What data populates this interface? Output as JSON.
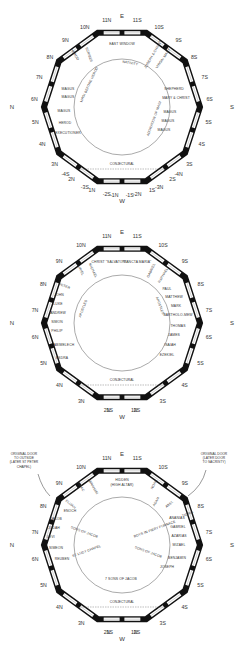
{
  "diagrams": [
    {
      "name": "plan-1",
      "cy": 107,
      "compass": {
        "top": "E",
        "bottom": "W",
        "left": "N",
        "right": "S"
      },
      "positions_left": [
        "11N",
        "10N",
        "9N",
        "8N",
        "7N",
        "6N",
        "5N",
        "4N",
        "3N",
        "2N",
        "1N",
        "-1N",
        "-2N",
        "-3N",
        "-4N"
      ],
      "positions_right": [
        "11S",
        "10S",
        "9S",
        "8S",
        "7S",
        "6S",
        "5S",
        "4S",
        "3S",
        "2S",
        "1S",
        "-1S",
        "-2S",
        "-3S",
        "-4S"
      ],
      "bottom_note": "CONJECTURAL",
      "labels": {
        "east_window": "EAST WINDOW",
        "nativity": "NATIVITY",
        "magi_before_herod": "MAGI BEFORE HEROD",
        "adoration_of_magi": "ADORATION OF MAGI",
        "herod": "HEROD",
        "scribes": "SCRIBES",
        "joseph_christ": "JOSEPH & CHRIST",
        "virgin_mary": "VIRGIN MARY",
        "shepherd": "SHEPHERD",
        "mary_christ": "MARY & CHRIST",
        "magus_l1": "MAGUS",
        "magus_l2": "MAGUS",
        "magus_l3": "MAGUS",
        "herod_l": "HEROD",
        "executioner": "EXECUTIONER",
        "magus_r1": "MAGUS",
        "magus_r2": "MAGUS",
        "magus_r3": "MAGUS"
      }
    },
    {
      "name": "plan-2",
      "cy": 323,
      "compass": {
        "top": "E",
        "bottom": "W",
        "left": "N",
        "right": "S"
      },
      "positions_left": [
        "11N",
        "10N",
        "9N",
        "8N",
        "7N",
        "6N",
        "5N",
        "4N",
        "3N",
        "2N",
        "1N"
      ],
      "positions_right": [
        "11S",
        "10S",
        "9S",
        "8S",
        "7S",
        "6S",
        "5S",
        "4S",
        "3S",
        "2S",
        "1S"
      ],
      "bottom_note": "CONJECTURAL",
      "labels": {
        "christ_salvator": "CHRIST \"SALVATOR\"",
        "sancta_maria": "\"SANCTA MARIA\"",
        "uriel": "URIEL",
        "michael": "MICHAEL",
        "gabriel": "GABRIEL",
        "raphael": "RAPHAEL",
        "peter": "PETER",
        "john": "JOHN",
        "luke": "LUKE",
        "andrew": "ANDREW",
        "simon": "SIMON",
        "philip": "PHILIP",
        "apostles_l": "APOSTLES",
        "abimelech": "ABIMELECH",
        "esdra": "ESDRA",
        "paul": "PAUL",
        "matthew": "MATTHEW",
        "mark": "MARK",
        "bartholomew": "BARTHOLO-MEW",
        "thomas": "THOMAS",
        "james": "JAMES",
        "apostles_r": "APOSTLES",
        "isaiah": "ISAIAH",
        "ezekiel": "EZEKIEL"
      }
    },
    {
      "name": "plan-3",
      "cy": 545,
      "compass": {
        "top": "E",
        "bottom": "W",
        "left": "N",
        "right": "S"
      },
      "positions_left": [
        "11N",
        "10N",
        "9N",
        "8N",
        "7N",
        "6N",
        "5N",
        "4N",
        "3N",
        "2N",
        "1N"
      ],
      "positions_right": [
        "11S",
        "10S",
        "9S",
        "8S",
        "7S",
        "6S",
        "5S",
        "4S",
        "3S",
        "2S",
        "1S"
      ],
      "bottom_note": "CONJECTURAL",
      "notes": {
        "left_door": [
          "ORIGINAL DOOR",
          "TO OUTSIDE",
          "(LATER ST PETER",
          "CHAPEL)"
        ],
        "right_door": [
          "ORIGINAL DOOR",
          "(LATER DOOR",
          "TO SACRISTY)"
        ]
      },
      "labels": {
        "hidden": "HIDDEN",
        "high_altar": "(HIGH ALTAR)",
        "isaac": "ISAAC",
        "abraham": "ABRAHAM",
        "noah": "NOAH",
        "adam": "ADAM",
        "abel": "ABEL",
        "elijah": "ELIJAH",
        "enoch": "ENOCH",
        "jacob": "JACOB",
        "judah": "JUDAH",
        "levi": "LEVI",
        "simeon": "SIMEON",
        "reuben": "REUBEN",
        "sons_of_jacob_l": "SONS OF JACOB",
        "st_lucy_chapel": "ST LUCY CHAPEL",
        "seven_sons_of_jacob": "7 SONS OF JACOB",
        "boys_in_fiery_furnace": "BOYS IN FIERY FURNACE",
        "ananias": "ANANIAS",
        "gabriel": "GABRIEL",
        "azarias": "AZARIAS",
        "mizael": "MIZAEL",
        "sons_of_jacob_r": "SONS OF JACOB",
        "benjamin": "BENJAMIN",
        "joseph": "JOSEPH",
        "tigris": "TIGRIS"
      }
    }
  ],
  "colors": {
    "wall": "#111111",
    "window": "#ffffff",
    "text": "#222222",
    "background": "#ffffff"
  }
}
